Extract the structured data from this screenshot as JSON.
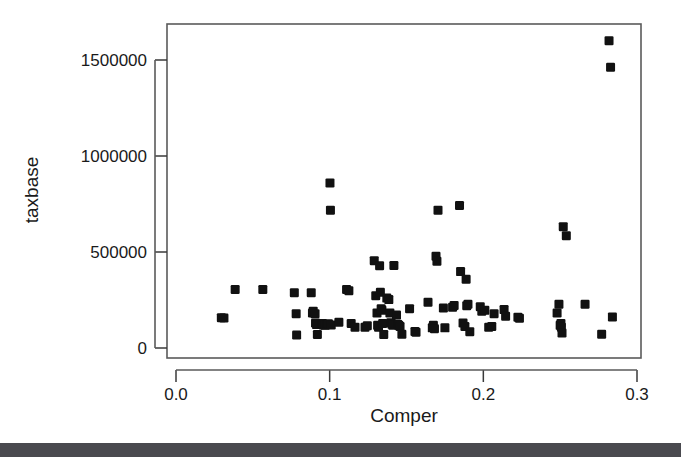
{
  "figure": {
    "background_color": "#ffffff",
    "frame_color": "#5a5a5a",
    "point_color": "#111111",
    "bottom_bar_color": "#4a4a4f"
  },
  "chart_data": {
    "type": "scatter",
    "title": "",
    "xlabel": "Comper",
    "ylabel": "taxbase",
    "xlim": [
      0.0,
      0.3
    ],
    "ylim": [
      0,
      1650000
    ],
    "xticks": [
      0.0,
      0.1,
      0.2,
      0.3
    ],
    "xtick_labels": [
      "0.0",
      "0.1",
      "0.2",
      "0.3"
    ],
    "yticks": [
      0,
      500000,
      1000000,
      1500000
    ],
    "ytick_labels": [
      "0",
      "500000",
      "1000000",
      "1500000"
    ],
    "grid": false,
    "legend": false,
    "marker": "filled-square",
    "marker_size": 9,
    "n_points": 97,
    "points": [
      [
        0.0295,
        158000
      ],
      [
        0.0312,
        156000
      ],
      [
        0.0385,
        305000
      ],
      [
        0.0565,
        305000
      ],
      [
        0.077,
        288000
      ],
      [
        0.0782,
        178000
      ],
      [
        0.0785,
        68000
      ],
      [
        0.088,
        288000
      ],
      [
        0.0888,
        182000
      ],
      [
        0.0893,
        192000
      ],
      [
        0.0905,
        178000
      ],
      [
        0.0908,
        130000
      ],
      [
        0.0915,
        122000
      ],
      [
        0.092,
        70000
      ],
      [
        0.0952,
        128000
      ],
      [
        0.0958,
        120000
      ],
      [
        0.097,
        118000
      ],
      [
        0.0985,
        122000
      ],
      [
        0.0992,
        126000
      ],
      [
        0.1002,
        860000
      ],
      [
        0.1005,
        718000
      ],
      [
        0.101,
        120000
      ],
      [
        0.106,
        134000
      ],
      [
        0.111,
        305000
      ],
      [
        0.1125,
        298000
      ],
      [
        0.114,
        128000
      ],
      [
        0.1165,
        108000
      ],
      [
        0.123,
        108000
      ],
      [
        0.1245,
        116000
      ],
      [
        0.129,
        455000
      ],
      [
        0.13,
        272000
      ],
      [
        0.1308,
        182000
      ],
      [
        0.1312,
        118000
      ],
      [
        0.1318,
        108000
      ],
      [
        0.1325,
        428000
      ],
      [
        0.133,
        290000
      ],
      [
        0.1335,
        204000
      ],
      [
        0.134,
        196000
      ],
      [
        0.1345,
        128000
      ],
      [
        0.1352,
        70000
      ],
      [
        0.1372,
        260000
      ],
      [
        0.1385,
        252000
      ],
      [
        0.1392,
        182000
      ],
      [
        0.1398,
        132000
      ],
      [
        0.1405,
        124000
      ],
      [
        0.1412,
        118000
      ],
      [
        0.1418,
        430000
      ],
      [
        0.1435,
        172000
      ],
      [
        0.1442,
        124000
      ],
      [
        0.145,
        118000
      ],
      [
        0.1458,
        112000
      ],
      [
        0.147,
        72000
      ],
      [
        0.152,
        205000
      ],
      [
        0.1555,
        86000
      ],
      [
        0.1562,
        82000
      ],
      [
        0.164,
        238000
      ],
      [
        0.1668,
        105000
      ],
      [
        0.1675,
        118000
      ],
      [
        0.1682,
        100000
      ],
      [
        0.1692,
        478000
      ],
      [
        0.1698,
        452000
      ],
      [
        0.1705,
        718000
      ],
      [
        0.174,
        208000
      ],
      [
        0.175,
        105000
      ],
      [
        0.18,
        212000
      ],
      [
        0.181,
        222000
      ],
      [
        0.1845,
        742000
      ],
      [
        0.1852,
        398000
      ],
      [
        0.1868,
        130000
      ],
      [
        0.188,
        112000
      ],
      [
        0.1888,
        358000
      ],
      [
        0.1892,
        220000
      ],
      [
        0.19,
        228000
      ],
      [
        0.1912,
        85000
      ],
      [
        0.198,
        215000
      ],
      [
        0.199,
        192000
      ],
      [
        0.201,
        196000
      ],
      [
        0.2035,
        108000
      ],
      [
        0.2055,
        112000
      ],
      [
        0.207,
        178000
      ],
      [
        0.2135,
        200000
      ],
      [
        0.2145,
        165000
      ],
      [
        0.2225,
        160000
      ],
      [
        0.2235,
        155000
      ],
      [
        0.248,
        182000
      ],
      [
        0.2492,
        228000
      ],
      [
        0.25,
        118000
      ],
      [
        0.2505,
        128000
      ],
      [
        0.2508,
        108000
      ],
      [
        0.2512,
        78000
      ],
      [
        0.252,
        632000
      ],
      [
        0.254,
        585000
      ],
      [
        0.2662,
        228000
      ],
      [
        0.277,
        72000
      ],
      [
        0.2818,
        1600000
      ],
      [
        0.2828,
        1462000
      ],
      [
        0.284,
        162000
      ]
    ]
  }
}
